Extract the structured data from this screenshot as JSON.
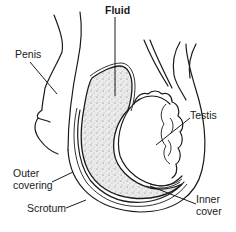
{
  "diagram": {
    "type": "anatomical-illustration",
    "labels": [
      {
        "id": "fluid",
        "text": "Fluid",
        "x": 105,
        "y": 4
      },
      {
        "id": "penis",
        "text": "Penis",
        "x": 15,
        "y": 48
      },
      {
        "id": "testis",
        "text": "Testis",
        "x": 188,
        "y": 109
      },
      {
        "id": "outer_covering_1",
        "text": "Outer",
        "x": 13,
        "y": 167
      },
      {
        "id": "outer_covering_2",
        "text": "covering",
        "x": 13,
        "y": 179
      },
      {
        "id": "scrotum",
        "text": "Scrotum",
        "x": 27,
        "y": 202
      },
      {
        "id": "inner_cover_1",
        "text": "Inner",
        "x": 196,
        "y": 193
      },
      {
        "id": "inner_cover_2",
        "text": "cover",
        "x": 196,
        "y": 205
      }
    ],
    "colors": {
      "ink": "#1a1a1a",
      "background": "#ffffff",
      "fluid_fill": "#e6e6e6"
    }
  }
}
